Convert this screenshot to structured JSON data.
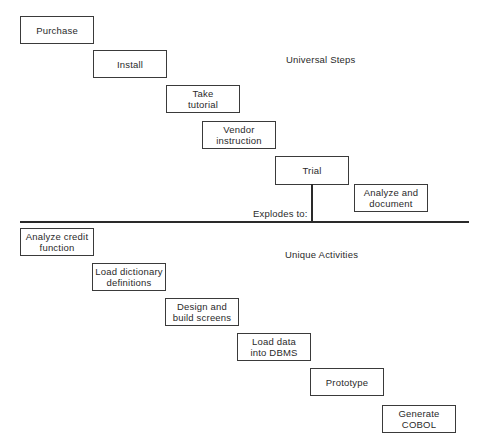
{
  "diagram": {
    "sections": {
      "universal_label": "Universal Steps",
      "unique_label": "Unique Activities",
      "explodes_label": "Explodes to:"
    },
    "universal_steps": [
      {
        "label": "Purchase"
      },
      {
        "label": "Install"
      },
      {
        "label": "Take\ntutorial"
      },
      {
        "label": "Vendor\ninstruction"
      },
      {
        "label": "Trial"
      },
      {
        "label": "Analyze and\ndocument"
      }
    ],
    "unique_activities": [
      {
        "label": "Analyze credit\nfunction"
      },
      {
        "label": "Load dictionary\ndefinitions"
      },
      {
        "label": "Design and\nbuild screens"
      },
      {
        "label": "Load data\ninto DBMS"
      },
      {
        "label": "Prototype"
      },
      {
        "label": "Generate\nCOBOL"
      }
    ]
  }
}
